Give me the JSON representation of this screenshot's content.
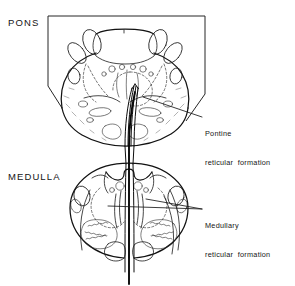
{
  "figure": {
    "kind": "anatomical-line-drawing",
    "background_color": "#ffffff",
    "ink_color": "#151515"
  },
  "sections": [
    {
      "id": "pons",
      "heading": "PONS",
      "description": "Transverse section through the pons, framed by a partial rectangular border"
    },
    {
      "id": "medulla",
      "heading": "MEDULLA",
      "description": "Transverse section through the medulla oblongata"
    }
  ],
  "callouts": [
    {
      "id": "pontine-reticular-formation",
      "line1": "Pontine",
      "line2": "reticular  formation",
      "points_to": "pons"
    },
    {
      "id": "medullary-reticular-formation",
      "line1": "Medullary",
      "line2": "reticular  formation",
      "points_to": "medulla"
    }
  ]
}
